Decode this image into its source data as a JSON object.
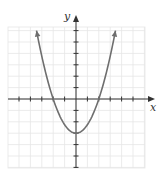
{
  "chart_data": {
    "type": "line",
    "title": "",
    "xlabel": "x",
    "ylabel": "y",
    "function": "y = 0.75x^2 - 3",
    "xlim": [
      -6,
      6
    ],
    "ylim": [
      -6,
      6
    ],
    "grid": true,
    "x_ticks": [
      -5,
      -4,
      -3,
      -2,
      -1,
      1,
      2,
      3,
      4,
      5
    ],
    "y_ticks": [
      -6,
      -5,
      -4,
      -3,
      -2,
      -1,
      1,
      2,
      3,
      4,
      5,
      6
    ],
    "tick_labels_shown": false,
    "series": [
      {
        "name": "parabola",
        "x": [
          -3.46,
          -3,
          -2,
          -1,
          0,
          1,
          2,
          3,
          3.46
        ],
        "y": [
          6,
          3.75,
          0,
          -2.25,
          -3,
          -2.25,
          0,
          3.75,
          6
        ],
        "arrows_at_ends": true
      }
    ],
    "key_points": {
      "vertex": [
        0,
        -3
      ],
      "x_intercepts": [
        [
          -2,
          0
        ],
        [
          2,
          0
        ]
      ],
      "y_intercept": [
        0,
        -3
      ]
    }
  },
  "labels": {
    "x_axis": "x",
    "y_axis": "y"
  },
  "colors": {
    "grid": "#e6e6e6",
    "axis": "#333333",
    "curve": "#6e6e6e"
  }
}
